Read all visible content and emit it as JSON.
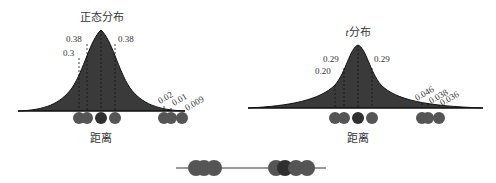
{
  "left_panel": {
    "title": "正态分布",
    "axis_label": "距离",
    "labels": {
      "l1": "0.38",
      "l2": "0.3",
      "r1": "0.38",
      "t1": "0.02",
      "t2": "0.01",
      "t3": "0.009"
    }
  },
  "right_panel": {
    "title_italic": "t",
    "title": "分布",
    "axis_label": "距离",
    "labels": {
      "l1": "0.29",
      "l2": "0.20",
      "r1": "0.29",
      "t1": "0.046",
      "t2": "0.038",
      "t3": "0.036"
    }
  },
  "colors": {
    "curve_fill": "#3a3a3a",
    "point": "#555555",
    "point_dark": "#2f2f2f",
    "dashed": "#111111"
  }
}
